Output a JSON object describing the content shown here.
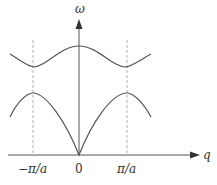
{
  "diagram": {
    "axes": {
      "y_label": "ω",
      "x_label": "q",
      "x_ticks": [
        "−π/a",
        "0",
        "π/a"
      ]
    },
    "branches": [
      {
        "name": "optical-branch",
        "description": "upper curve, maximum at q=0, minima at ±π/a"
      },
      {
        "name": "acoustic-branch",
        "description": "lower curve, zero at q=0, maxima at ±π/a"
      }
    ],
    "zone_boundaries": [
      "−π/a",
      "π/a"
    ],
    "colors": {
      "curve": "#555555",
      "axis": "#555555",
      "dashed": "#999999"
    }
  }
}
